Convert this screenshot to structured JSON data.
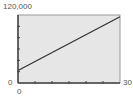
{
  "chart_data": {
    "type": "line",
    "title": "",
    "xlabel": "",
    "ylabel": "",
    "xlim": [
      0,
      30
    ],
    "ylim": [
      0,
      120000
    ],
    "x_ticks": [
      0,
      5,
      10,
      15,
      20,
      25,
      30
    ],
    "y_ticks": [
      0,
      20000,
      40000,
      60000,
      80000,
      100000,
      120000
    ],
    "grid": false,
    "legend": null,
    "series": [
      {
        "name": "line",
        "x": [
          0,
          30
        ],
        "y": [
          22000,
          117000
        ]
      }
    ],
    "axis_labels": {
      "y_max": "120,000",
      "y_min": "0",
      "x_min": "0",
      "x_max": "30"
    }
  },
  "colors": {
    "plot_background": "#e6e6e6",
    "axis": "#444444",
    "line": "#333333",
    "label": "#555555"
  }
}
